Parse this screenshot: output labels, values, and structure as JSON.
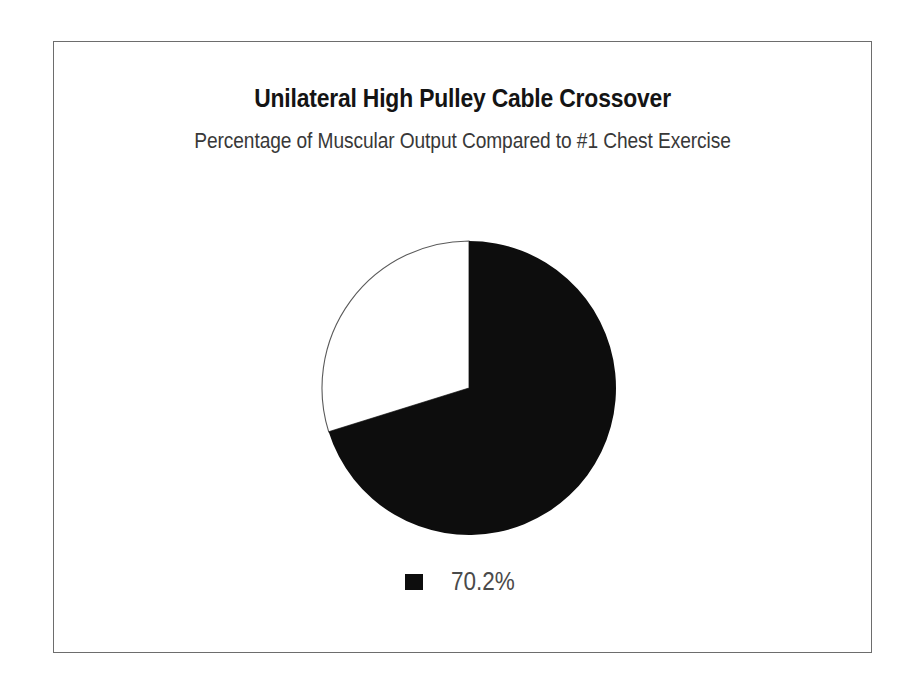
{
  "frame": {
    "border_color": "#6d6d6d",
    "background_color": "#ffffff"
  },
  "chart_data": {
    "type": "pie",
    "title": "Unilateral High Pulley Cable Crossover",
    "subtitle": "Percentage of Muscular Output Compared to #1 Chest Exercise",
    "categories": [
      "70.2%"
    ],
    "values": [
      70.2
    ],
    "remainder": 29.8,
    "value_labels": [
      "70.2%"
    ],
    "colors": [
      "#0d0d0d"
    ],
    "remainder_color": "#ffffff",
    "remainder_outline_color": "#5a5a5a",
    "start_angle_deg": 0,
    "sweep_direction": "clockwise",
    "slice_sweep_deg": 252.7,
    "legend": {
      "position": "bottom",
      "entries": [
        {
          "label": "70.2%",
          "color": "#0d0d0d"
        }
      ]
    },
    "xlabel": "",
    "ylabel": "",
    "grid": false
  }
}
